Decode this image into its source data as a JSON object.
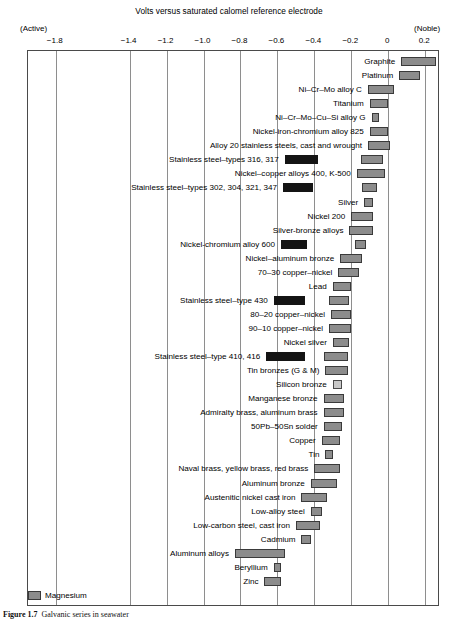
{
  "chart_data": {
    "type": "bar",
    "title": "Volts versus saturated calomel reference electrode",
    "subtitle": "",
    "xlabel": "Volts versus saturated calomel reference electrode",
    "ylabel": "",
    "orientation": "horizontal-range",
    "grid": true,
    "legend": "none",
    "xlim": [
      -1.95,
      0.28
    ],
    "xticks": [
      -1.8,
      -1.4,
      -1.2,
      -1.0,
      -0.8,
      -0.6,
      -0.4,
      -0.2,
      0,
      0.2
    ],
    "xtick_labels": [
      "−1.8",
      "−1.4",
      "−1.2",
      "−1.0",
      "−0.8",
      "−0.6",
      "−0.4",
      "−0.2",
      "0",
      "0.2"
    ],
    "end_labels": {
      "left": "(Active)",
      "right": "(Noble)"
    },
    "note": "Horizontal floating-bar (range) chart. Each material spans a potential range. Dark/black bars denote the active state of stainless steels; grey bars denote the normal/passive range.",
    "bars": [
      {
        "label": "Graphite",
        "x0": 0.07,
        "x1": 0.26,
        "style": "grey",
        "label_side": "left"
      },
      {
        "label": "Platinum",
        "x0": 0.06,
        "x1": 0.17,
        "style": "grey",
        "label_side": "left"
      },
      {
        "label": "Ni–Cr–Mo alloy C",
        "x0": -0.11,
        "x1": 0.03,
        "style": "grey",
        "label_side": "left"
      },
      {
        "label": "Titanium",
        "x0": -0.1,
        "x1": 0.0,
        "style": "grey",
        "label_side": "left"
      },
      {
        "label": "Ni–Cr–Mo–Cu–Si alloy G",
        "x0": -0.09,
        "x1": -0.05,
        "style": "grey",
        "label_side": "left"
      },
      {
        "label": "Nickel-iron-chromium alloy 825",
        "x0": -0.1,
        "x1": 0.0,
        "style": "grey",
        "label_side": "left"
      },
      {
        "label": "Alloy 20 stainless steels, cast and wrought",
        "x0": -0.11,
        "x1": 0.01,
        "style": "grey",
        "label_side": "left"
      },
      {
        "label": "Stainless steel–types 316, 317",
        "x0": -0.56,
        "x1": -0.38,
        "style": "dark",
        "label_side": "left",
        "second_bar": {
          "x0": -0.15,
          "x1": -0.03,
          "style": "grey"
        }
      },
      {
        "label": "Nickel–copper alloys 400, K-500",
        "x0": -0.17,
        "x1": -0.02,
        "style": "grey",
        "label_side": "left"
      },
      {
        "label": "Stainless steel–types 302, 304, 321, 347",
        "x0": -0.57,
        "x1": -0.41,
        "style": "dark",
        "label_side": "left",
        "second_bar": {
          "x0": -0.14,
          "x1": -0.06,
          "style": "grey"
        }
      },
      {
        "label": "Silver",
        "x0": -0.13,
        "x1": -0.08,
        "style": "grey",
        "label_side": "left"
      },
      {
        "label": "Nickel 200",
        "x0": -0.2,
        "x1": -0.08,
        "style": "grey",
        "label_side": "left"
      },
      {
        "label": "Silver-bronze alloys",
        "x0": -0.21,
        "x1": -0.08,
        "style": "grey",
        "label_side": "left"
      },
      {
        "label": "Nickel-chromium alloy 600",
        "x0": -0.58,
        "x1": -0.44,
        "style": "dark",
        "label_side": "left",
        "second_bar": {
          "x0": -0.18,
          "x1": -0.12,
          "style": "grey"
        }
      },
      {
        "label": "Nickel–aluminum bronze",
        "x0": -0.26,
        "x1": -0.14,
        "style": "grey",
        "label_side": "left"
      },
      {
        "label": "70–30 copper–nickel",
        "x0": -0.27,
        "x1": -0.16,
        "style": "grey",
        "label_side": "left"
      },
      {
        "label": "Lead",
        "x0": -0.3,
        "x1": -0.2,
        "style": "grey",
        "label_side": "left"
      },
      {
        "label": "Stainless steel–type 430",
        "x0": -0.62,
        "x1": -0.45,
        "style": "dark",
        "label_side": "left",
        "second_bar": {
          "x0": -0.32,
          "x1": -0.21,
          "style": "grey"
        }
      },
      {
        "label": "80–20 copper–nickel",
        "x0": -0.31,
        "x1": -0.2,
        "style": "grey",
        "label_side": "left"
      },
      {
        "label": "90–10 copper–nickel",
        "x0": -0.32,
        "x1": -0.2,
        "style": "grey",
        "label_side": "left"
      },
      {
        "label": "Nickel silver",
        "x0": -0.3,
        "x1": -0.21,
        "style": "grey",
        "label_side": "left"
      },
      {
        "label": "Stainless steel–type 410, 416",
        "x0": -0.66,
        "x1": -0.45,
        "style": "dark",
        "label_side": "left",
        "second_bar": {
          "x0": -0.35,
          "x1": -0.22,
          "style": "grey"
        }
      },
      {
        "label": "Tin bronzes (G & M)",
        "x0": -0.34,
        "x1": -0.22,
        "style": "grey",
        "label_side": "left"
      },
      {
        "label": "Silicon bronze",
        "x0": -0.3,
        "x1": -0.25,
        "style": "light",
        "label_side": "left"
      },
      {
        "label": "Manganese bronze",
        "x0": -0.35,
        "x1": -0.24,
        "style": "grey",
        "label_side": "left"
      },
      {
        "label": "Admiralty brass, aluminum brass",
        "x0": -0.35,
        "x1": -0.24,
        "style": "grey",
        "label_side": "left"
      },
      {
        "label": "50Pb–50Sn solder",
        "x0": -0.35,
        "x1": -0.25,
        "style": "grey",
        "label_side": "left"
      },
      {
        "label": "Copper",
        "x0": -0.36,
        "x1": -0.26,
        "style": "grey",
        "label_side": "left"
      },
      {
        "label": "Tin",
        "x0": -0.34,
        "x1": -0.3,
        "style": "grey",
        "label_side": "left"
      },
      {
        "label": "Naval brass, yellow brass, red brass",
        "x0": -0.4,
        "x1": -0.26,
        "style": "grey",
        "label_side": "left"
      },
      {
        "label": "Aluminum bronze",
        "x0": -0.42,
        "x1": -0.28,
        "style": "grey",
        "label_side": "left"
      },
      {
        "label": "Austenitic nickel cast iron",
        "x0": -0.47,
        "x1": -0.33,
        "style": "grey",
        "label_side": "left"
      },
      {
        "label": "Low-alloy steel",
        "x0": -0.42,
        "x1": -0.36,
        "style": "grey",
        "label_side": "left"
      },
      {
        "label": "Low-carbon steel, cast iron",
        "x0": -0.5,
        "x1": -0.37,
        "style": "grey",
        "label_side": "left"
      },
      {
        "label": "Cadmium",
        "x0": -0.47,
        "x1": -0.42,
        "style": "grey",
        "label_side": "left"
      },
      {
        "label": "Aluminum alloys",
        "x0": -0.83,
        "x1": -0.56,
        "style": "grey",
        "label_side": "left"
      },
      {
        "label": "Beryllium",
        "x0": -0.62,
        "x1": -0.58,
        "style": "grey",
        "label_side": "left"
      },
      {
        "label": "Zinc",
        "x0": -0.67,
        "x1": -0.58,
        "style": "grey",
        "label_side": "left"
      },
      {
        "label": "Magnesium",
        "x0": -1.95,
        "x1": -1.88,
        "style": "grey",
        "label_side": "right"
      }
    ]
  },
  "caption": {
    "figure_number": "Figure 1.7",
    "text": "Galvanic series in seawater"
  }
}
